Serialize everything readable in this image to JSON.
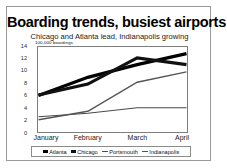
{
  "chart_data": {
    "type": "line",
    "title": "Boarding trends, busiest airports",
    "subtitle": "Chicago and Atlanta lead, Indianapolis growing",
    "ylabel": "100,000 boardings",
    "xlabel": "",
    "categories": [
      "January",
      "February",
      "March",
      "April"
    ],
    "yticks": [
      "14",
      "12",
      "10",
      "8",
      "6",
      "4",
      "2",
      "0"
    ],
    "ylim": [
      0,
      14
    ],
    "grid": false,
    "legend_position": "bottom",
    "series": [
      {
        "name": "Atlanta",
        "values": [
          6.0,
          9.0,
          11.1,
          12.9
        ],
        "color": "#000000",
        "marker": "thick-line-swatch",
        "width": 3.2
      },
      {
        "name": "Chicago",
        "values": [
          6.1,
          7.9,
          12.2,
          11.1
        ],
        "color": "#111111",
        "marker": "thick-line-swatch",
        "width": 3.2
      },
      {
        "name": "Portsmouth",
        "values": [
          2.5,
          3.1,
          4.0,
          4.0
        ],
        "color": "#4a4a4a",
        "marker": "thin-line-swatch",
        "width": 1.1
      },
      {
        "name": "Indianapolis",
        "values": [
          2.0,
          3.4,
          8.2,
          9.9
        ],
        "color": "#555555",
        "marker": "medium-line-swatch",
        "width": 1.5
      }
    ]
  }
}
